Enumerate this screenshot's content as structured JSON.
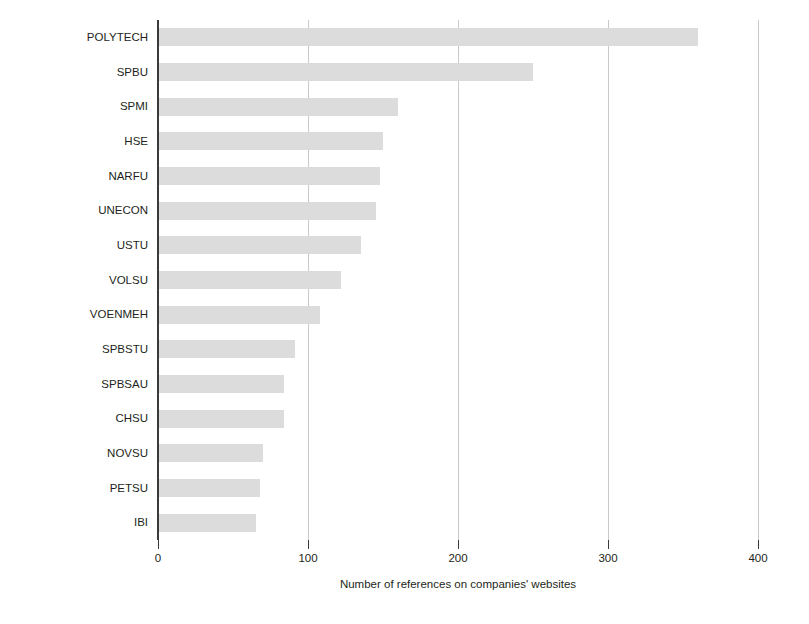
{
  "chart_data": {
    "type": "bar",
    "orientation": "horizontal",
    "title": "",
    "xlabel": "Number of references on companies' websites",
    "ylabel": "University",
    "xlim": [
      0,
      400
    ],
    "xticks": [
      0,
      100,
      200,
      300,
      400
    ],
    "grid": "vertical",
    "legend": "none",
    "bar_color": "#dcdcdc",
    "axis_color": "#3a3a3a",
    "grid_color": "#c9c9c9",
    "categories": [
      "POLYTECH",
      "SPBU",
      "SPMI",
      "HSE",
      "NARFU",
      "UNECON",
      "USTU",
      "VOLSU",
      "VOENMEH",
      "SPBSTU",
      "SPBSAU",
      "CHSU",
      "NOVSU",
      "PETSU",
      "IBI"
    ],
    "values": [
      360,
      250,
      160,
      150,
      148,
      145,
      135,
      122,
      108,
      91,
      84,
      84,
      70,
      68,
      65
    ]
  }
}
